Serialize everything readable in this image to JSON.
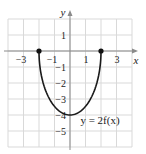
{
  "chart_data": {
    "type": "line",
    "title": "",
    "xlabel": "x",
    "ylabel": "y",
    "xlim": [
      -4,
      4
    ],
    "ylim": [
      -6,
      2
    ],
    "grid": true,
    "x_ticks": [
      -3,
      -1,
      1,
      3
    ],
    "y_ticks": [
      1,
      -1,
      -2,
      -3,
      -4,
      -5
    ],
    "series": [
      {
        "name": "y = 2f(x)",
        "x": [
          -2,
          -1.5,
          -1,
          -0.5,
          0,
          0.5,
          1,
          1.5,
          2
        ],
        "y": [
          0,
          -2.65,
          -3.46,
          -3.87,
          -4,
          -3.87,
          -3.46,
          -2.65,
          0
        ]
      }
    ],
    "endpoints": [
      {
        "x": -2,
        "y": 0,
        "filled": true
      },
      {
        "x": 2,
        "y": 0,
        "filled": true
      }
    ],
    "annotations": [
      {
        "text": "y = 2f(x)",
        "x": 2,
        "y": -4.2
      }
    ]
  },
  "labels": {
    "x_axis": "x",
    "y_axis": "y",
    "equation": "y = 2f(x)",
    "ticks_x": [
      "−3",
      "−1",
      "1",
      "3"
    ],
    "ticks_y": [
      "1",
      "−1",
      "−2",
      "−3",
      "−4",
      "−5"
    ]
  },
  "colors": {
    "grid": "#d9d9d9",
    "axis": "#8a8a8a",
    "curve": "#1a1a1a",
    "text": "#222222"
  }
}
